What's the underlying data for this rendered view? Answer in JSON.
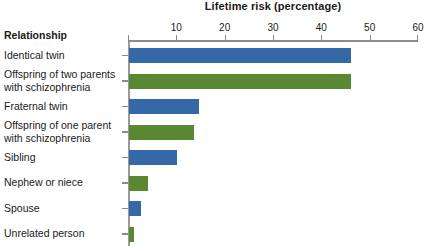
{
  "chart_data": {
    "type": "bar",
    "orientation": "horizontal",
    "title": "Lifetime risk (percentage)",
    "xlabel": "Lifetime risk (percentage)",
    "ylabel": "Relationship",
    "categories": [
      "Identical twin",
      "Offspring of two parents with schizophrenia",
      "Fraternal twin",
      "Offspring of one parent with schizophrenia",
      "Sibling",
      "Nephew or niece",
      "Spouse",
      "Unrelated person"
    ],
    "values": [
      46,
      46,
      14.5,
      13.5,
      10,
      4,
      2.5,
      1
    ],
    "xlim": [
      0,
      60
    ],
    "xticks": [
      0,
      10,
      20,
      30,
      40,
      50,
      60
    ],
    "xtick_labels": [
      "",
      "10",
      "20",
      "30",
      "40",
      "50",
      "60"
    ],
    "grid": false,
    "legend": "none",
    "colors": {
      "blue": "#3568a6",
      "green": "#5a8731",
      "axis": "#8b8b8b",
      "text": "#1a1a1a",
      "background": "#ffffff"
    },
    "bars": [
      {
        "label_line1": "Identical twin",
        "label_line2": "",
        "value": 46,
        "color": "blue"
      },
      {
        "label_line1": "Offspring of two parents",
        "label_line2": "with schizophrenia",
        "value": 46,
        "color": "green"
      },
      {
        "label_line1": "Fraternal twin",
        "label_line2": "",
        "value": 14.5,
        "color": "blue"
      },
      {
        "label_line1": "Offspring of one parent",
        "label_line2": "with schizophrenia",
        "value": 13.5,
        "color": "green"
      },
      {
        "label_line1": "Sibling",
        "label_line2": "",
        "value": 10,
        "color": "blue"
      },
      {
        "label_line1": "Nephew or niece",
        "label_line2": "",
        "value": 4,
        "color": "green"
      },
      {
        "label_line1": "Spouse",
        "label_line2": "",
        "value": 2.5,
        "color": "blue"
      },
      {
        "label_line1": "Unrelated person",
        "label_line2": "",
        "value": 1,
        "color": "green"
      }
    ]
  },
  "axis": {
    "category_header": "Relationship"
  }
}
